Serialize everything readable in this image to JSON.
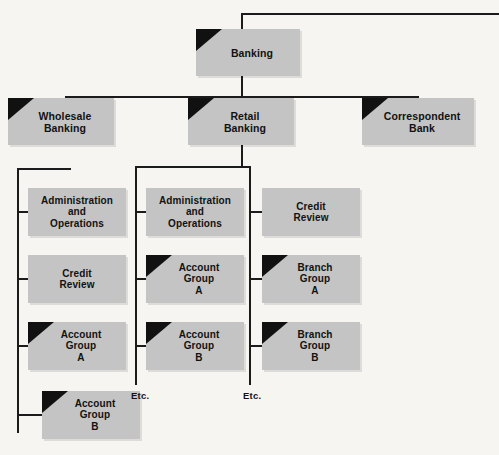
{
  "diagram": {
    "type": "org-chart",
    "colors": {
      "background": "#f6f5f2",
      "box_fill": "#c4c4c4",
      "line": "#1b1b1b",
      "flag": "#111111",
      "text": "#121212"
    },
    "nodes": [
      {
        "id": "banking",
        "label": "Banking",
        "flag": true,
        "level": 0,
        "x": 196,
        "y": 29,
        "w": 104,
        "h": 47
      },
      {
        "id": "wholesale-banking",
        "label": "Wholesale\nBanking",
        "flag": true,
        "level": 1,
        "x": 8,
        "y": 98,
        "w": 106,
        "h": 47
      },
      {
        "id": "retail-banking",
        "label": "Retail\nBanking",
        "flag": true,
        "level": 1,
        "x": 188,
        "y": 98,
        "w": 106,
        "h": 47
      },
      {
        "id": "correspondent-bank",
        "label": "Correspondent\nBank",
        "flag": true,
        "level": 1,
        "x": 362,
        "y": 98,
        "w": 112,
        "h": 47
      },
      {
        "id": "wb-admin-ops",
        "label": "Administration\nand\nOperations",
        "flag": false,
        "level": 2,
        "x": 28,
        "y": 188,
        "w": 98,
        "h": 48
      },
      {
        "id": "wb-credit-review",
        "label": "Credit\nReview",
        "flag": false,
        "level": 2,
        "x": 28,
        "y": 255,
        "w": 98,
        "h": 48
      },
      {
        "id": "wb-account-group-a",
        "label": "Account\nGroup\nA",
        "flag": true,
        "level": 2,
        "x": 28,
        "y": 322,
        "w": 98,
        "h": 48
      },
      {
        "id": "wb-account-group-b",
        "label": "Account\nGroup\nB",
        "flag": true,
        "level": 2,
        "x": 42,
        "y": 391,
        "w": 98,
        "h": 48
      },
      {
        "id": "rb-admin-ops",
        "label": "Administration\nand\nOperations",
        "flag": false,
        "level": 2,
        "x": 146,
        "y": 188,
        "w": 98,
        "h": 48
      },
      {
        "id": "rb-account-group-a",
        "label": "Account\nGroup\nA",
        "flag": true,
        "level": 2,
        "x": 146,
        "y": 255,
        "w": 98,
        "h": 48
      },
      {
        "id": "rb-account-group-b",
        "label": "Account\nGroup\nB",
        "flag": true,
        "level": 2,
        "x": 146,
        "y": 322,
        "w": 98,
        "h": 48
      },
      {
        "id": "rb-credit-review",
        "label": "Credit\nReview",
        "flag": false,
        "level": 2,
        "x": 262,
        "y": 188,
        "w": 98,
        "h": 48
      },
      {
        "id": "rb-branch-group-a",
        "label": "Branch\nGroup\nA",
        "flag": true,
        "level": 2,
        "x": 262,
        "y": 255,
        "w": 98,
        "h": 48
      },
      {
        "id": "rb-branch-group-b",
        "label": "Branch\nGroup\nB",
        "flag": true,
        "level": 2,
        "x": 262,
        "y": 322,
        "w": 98,
        "h": 48
      }
    ],
    "etc_labels": [
      {
        "id": "etc-retail-middle",
        "text": "Etc.",
        "x": 131,
        "y": 390
      },
      {
        "id": "etc-retail-right",
        "text": "Etc.",
        "x": 243,
        "y": 390
      }
    ],
    "lines": [
      {
        "id": "root-stem-up",
        "orient": "v",
        "x": 241,
        "y": 13,
        "len": 16
      },
      {
        "id": "root-top-rail",
        "orient": "h",
        "x": 241,
        "y": 13,
        "len": 258
      },
      {
        "id": "banking-stem-down",
        "orient": "v",
        "x": 241,
        "y": 76,
        "len": 22
      },
      {
        "id": "level1-rail",
        "orient": "h",
        "x": 65,
        "y": 96,
        "len": 353
      },
      {
        "id": "wholesale-stem",
        "orient": "v",
        "x": 65,
        "y": 96,
        "len": 4
      },
      {
        "id": "correspondent-stem",
        "orient": "v",
        "x": 417,
        "y": 96,
        "len": 4
      },
      {
        "id": "wb-drop",
        "orient": "v",
        "x": 17,
        "y": 168,
        "len": 265
      },
      {
        "id": "wb-drop-top-rail",
        "orient": "h",
        "x": 17,
        "y": 168,
        "len": 54
      },
      {
        "id": "wb-branch-1",
        "orient": "h",
        "x": 17,
        "y": 211,
        "len": 13
      },
      {
        "id": "wb-branch-2",
        "orient": "h",
        "x": 17,
        "y": 278,
        "len": 13
      },
      {
        "id": "wb-branch-3",
        "orient": "h",
        "x": 17,
        "y": 345,
        "len": 13
      },
      {
        "id": "wb-branch-4",
        "orient": "h",
        "x": 17,
        "y": 414,
        "len": 27
      },
      {
        "id": "rb-stem-down",
        "orient": "v",
        "x": 241,
        "y": 145,
        "len": 23
      },
      {
        "id": "rb-split-rail",
        "orient": "h",
        "x": 135,
        "y": 166,
        "len": 116
      },
      {
        "id": "rb-mid-drop",
        "orient": "v",
        "x": 135,
        "y": 166,
        "len": 219
      },
      {
        "id": "rb-mid-branch-1",
        "orient": "h",
        "x": 135,
        "y": 211,
        "len": 13
      },
      {
        "id": "rb-mid-branch-2",
        "orient": "h",
        "x": 135,
        "y": 278,
        "len": 13
      },
      {
        "id": "rb-mid-branch-3",
        "orient": "h",
        "x": 135,
        "y": 345,
        "len": 13
      },
      {
        "id": "rb-right-drop",
        "orient": "v",
        "x": 249,
        "y": 166,
        "len": 219
      },
      {
        "id": "rb-right-branch-1",
        "orient": "h",
        "x": 249,
        "y": 211,
        "len": 15
      },
      {
        "id": "rb-right-branch-2",
        "orient": "h",
        "x": 249,
        "y": 278,
        "len": 15
      },
      {
        "id": "rb-right-branch-3",
        "orient": "h",
        "x": 249,
        "y": 345,
        "len": 15
      }
    ]
  }
}
